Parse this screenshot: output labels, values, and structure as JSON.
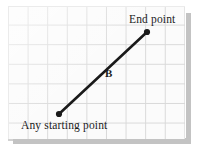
{
  "figure": {
    "background_color": "#ffffff",
    "panel": {
      "name": "graph-paper",
      "fill_color": "#fbfbfb",
      "grid_line_color": "#d9d9d9",
      "grid_cell_px": 19.6,
      "shadow_color": "#c3c3c3"
    },
    "labels": {
      "end_point": "End point",
      "start_point": "Any starting point",
      "vector_name": "B"
    },
    "vector": {
      "name": "vector-b",
      "color": "#1a1a1a",
      "line_width_px": 2.6,
      "start": {
        "x": 59,
        "y": 114
      },
      "end": {
        "x": 147,
        "y": 32
      },
      "start_marker": "round-dot",
      "end_marker": "round-dot",
      "marker_radius_px": 3.1
    }
  }
}
